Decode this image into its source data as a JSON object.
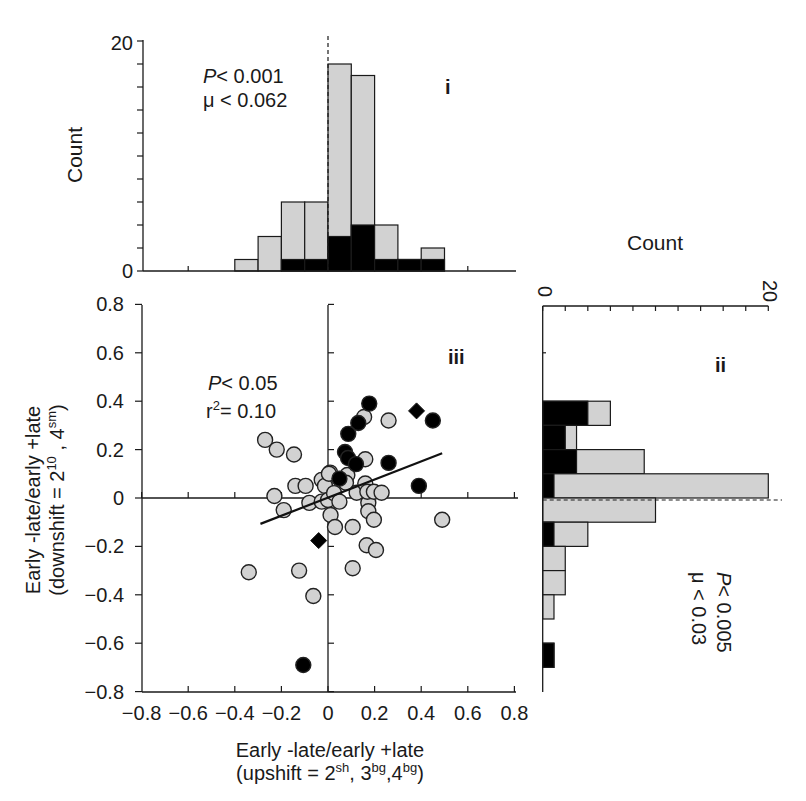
{
  "chart_data": [
    {
      "id": "i",
      "type": "bar",
      "orientation": "vertical",
      "stacked": true,
      "panel_label": "i",
      "ylabel": "Count",
      "ylim": [
        0,
        20
      ],
      "y_ticks_labeled": [
        "0",
        "20"
      ],
      "y_minor_tick_step": 2,
      "xlim": [
        -0.8,
        0.8
      ],
      "bin_edges": [
        -0.4,
        -0.3,
        -0.2,
        -0.1,
        0.0,
        0.1,
        0.2,
        0.3,
        0.4,
        0.5
      ],
      "categories": [
        "-0.4–-0.3",
        "-0.3–-0.2",
        "-0.2–-0.1",
        "-0.1–0",
        "0–0.1",
        "0.1–0.2",
        "0.2–0.3",
        "0.3–0.4",
        "0.4–0.5"
      ],
      "series": [
        {
          "name": "black",
          "color": "#000000",
          "values": [
            0,
            0,
            1,
            1,
            3,
            4,
            1,
            1,
            1
          ]
        },
        {
          "name": "gray",
          "color": "#d2d2d2",
          "values": [
            1,
            3,
            5,
            5,
            15,
            13,
            3,
            0,
            1
          ]
        }
      ],
      "totals": [
        1,
        3,
        6,
        6,
        18,
        17,
        4,
        1,
        2
      ],
      "reference_line": {
        "x": 0,
        "style": "dashed"
      },
      "annotations": [
        "P < 0.001",
        "μ < 0.062"
      ]
    },
    {
      "id": "ii",
      "type": "bar",
      "orientation": "horizontal",
      "stacked": true,
      "panel_label": "ii",
      "xlabel": "Count",
      "xlim": [
        0,
        20
      ],
      "x_ticks_labeled": [
        "0",
        "20"
      ],
      "x_minor_tick_step": 2,
      "ylim": [
        -0.8,
        0.8
      ],
      "bin_edges": [
        0.4,
        0.3,
        0.2,
        0.1,
        0.0,
        -0.1,
        -0.2,
        -0.3,
        -0.4,
        -0.5,
        -0.6,
        -0.7
      ],
      "categories": [
        "0.3–0.4",
        "0.2–0.3",
        "0.1–0.2",
        "0–0.1",
        "-0.1–0",
        "-0.2–-0.1",
        "-0.3–-0.2",
        "-0.4–-0.3",
        "-0.5–-0.4",
        "-0.6–-0.5",
        "-0.7–-0.6"
      ],
      "series": [
        {
          "name": "black",
          "color": "#000000",
          "values": [
            4,
            2,
            3,
            1,
            0,
            1,
            0,
            0,
            0,
            0,
            1
          ]
        },
        {
          "name": "gray",
          "color": "#d2d2d2",
          "values": [
            2,
            1,
            6,
            19,
            10,
            3,
            2,
            2,
            1,
            0,
            0
          ]
        }
      ],
      "totals": [
        6,
        3,
        9,
        20,
        10,
        4,
        2,
        2,
        1,
        0,
        1
      ],
      "reference_line": {
        "y": 0,
        "style": "dashed"
      },
      "annotations": [
        "P < 0.005",
        "μ < 0.03"
      ]
    },
    {
      "id": "iii",
      "type": "scatter",
      "panel_label": "iii",
      "xlabel": "Early -late/early +late (upshift = 2^sh, 3^bg,4^bg)",
      "ylabel": "Early -late/early +late (downshift = 2^10 , 4^sm)",
      "xlim": [
        -0.8,
        0.8
      ],
      "ylim": [
        -0.8,
        0.8
      ],
      "x_ticks": [
        "−0.8",
        "−0.6",
        "−0.4",
        "−0.2",
        "0",
        "0.2",
        "0.4",
        "0.6",
        "0.8"
      ],
      "y_ticks": [
        "0.8",
        "0.6",
        "0.4",
        "0.2",
        "0",
        "−0.2",
        "−0.4",
        "−0.6",
        "−0.8"
      ],
      "annotations": [
        "P < 0.05",
        "r² = 0.10"
      ],
      "regression_line": {
        "x": [
          -0.29,
          0.49
        ],
        "y": [
          -0.107,
          0.185
        ]
      },
      "series": [
        {
          "name": "gray circles",
          "marker": "circle",
          "color": "#d2d2d2",
          "points": [
            [
              -0.27,
              0.24
            ],
            [
              -0.22,
              0.2
            ],
            [
              -0.146,
              0.18
            ],
            [
              -0.23,
              0.008
            ],
            [
              -0.19,
              -0.05
            ],
            [
              -0.14,
              0.05
            ],
            [
              -0.096,
              0.05
            ],
            [
              -0.08,
              -0.02
            ],
            [
              -0.027,
              0.075
            ],
            [
              0.009,
              0.105
            ],
            [
              -0.013,
              0.05
            ],
            [
              -0.027,
              -0.015
            ],
            [
              0.0,
              -0.008
            ],
            [
              0.026,
              0.02
            ],
            [
              0.049,
              -0.015
            ],
            [
              0.011,
              -0.07
            ],
            [
              0.03,
              -0.12
            ],
            [
              0.106,
              -0.12
            ],
            [
              -0.34,
              -0.307
            ],
            [
              -0.124,
              -0.3
            ],
            [
              -0.063,
              -0.405
            ],
            [
              0.106,
              -0.29
            ],
            [
              0.166,
              -0.195
            ],
            [
              0.206,
              -0.215
            ],
            [
              0.173,
              -0.02
            ],
            [
              0.173,
              -0.055
            ],
            [
              0.197,
              -0.09
            ],
            [
              0.083,
              0.095
            ],
            [
              0.077,
              0.063
            ],
            [
              0.123,
              0.022
            ],
            [
              0.16,
              0.06
            ],
            [
              0.169,
              0.026
            ],
            [
              0.197,
              0.026
            ],
            [
              0.23,
              0.022
            ],
            [
              0.49,
              -0.09
            ],
            [
              0.16,
              0.16
            ],
            [
              0.155,
              0.335
            ],
            [
              0.26,
              0.32
            ],
            [
              0.004,
              0.1
            ]
          ]
        },
        {
          "name": "black circles",
          "marker": "circle",
          "color": "#000000",
          "points": [
            [
              0.177,
              0.39
            ],
            [
              0.45,
              0.32
            ],
            [
              0.13,
              0.31
            ],
            [
              0.087,
              0.265
            ],
            [
              0.073,
              0.19
            ],
            [
              0.086,
              0.165
            ],
            [
              0.12,
              0.14
            ],
            [
              0.26,
              0.145
            ],
            [
              0.39,
              0.05
            ],
            [
              0.049,
              0.08
            ],
            [
              -0.106,
              -0.69
            ]
          ]
        },
        {
          "name": "black diamonds",
          "marker": "diamond",
          "color": "#000000",
          "points": [
            [
              0.38,
              0.36
            ],
            [
              -0.04,
              -0.176
            ]
          ]
        }
      ]
    }
  ],
  "panel_i": {
    "label": "i",
    "axis_title": "Count",
    "tick_top": "20",
    "tick_bottom": "0",
    "stat_p_prefix": "P",
    "stat_p_rest": "< 0.001",
    "stat_mu": "μ < 0.062"
  },
  "panel_ii": {
    "label": "ii",
    "axis_title": "Count",
    "tick_left": "0",
    "tick_right": "20",
    "stat_p_prefix": "P",
    "stat_p_rest": "< 0.005",
    "stat_mu": "μ < 0.03"
  },
  "panel_iii": {
    "label": "iii",
    "stat_p_prefix": "P",
    "stat_p_rest": "< 0.05",
    "stat_r_base": "r",
    "stat_r_sup": "2",
    "stat_r_rest": "= 0.10",
    "xlabel_line1": "Early -late/early +late",
    "xlabel_line2_parts": [
      "(upshift = 2",
      "sh",
      ", 3",
      "bg",
      ",4",
      "bg",
      ")"
    ],
    "ylabel_line1": "Early -late/early +late",
    "ylabel_line2_parts": [
      "(downshift = 2",
      "10",
      " , 4",
      "sm",
      ")"
    ]
  },
  "colors": {
    "gray_fill": "#d2d2d2",
    "black_fill": "#000000",
    "axis": "#1a1a1a",
    "background": "#ffffff"
  }
}
